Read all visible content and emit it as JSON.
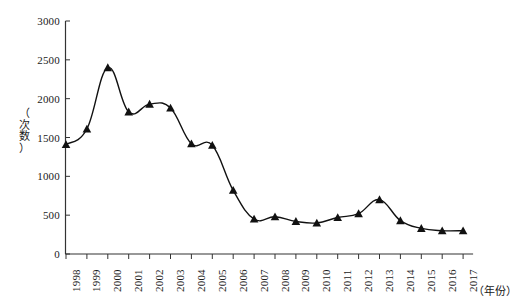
{
  "chart_data": {
    "type": "line",
    "title": "",
    "xlabel": "（年份）",
    "ylabel": "（次数）",
    "categories": [
      "1998",
      "1999",
      "2000",
      "2001",
      "2002",
      "2003",
      "2004",
      "2005",
      "2006",
      "2007",
      "2008",
      "2009",
      "2010",
      "2011",
      "2012",
      "2013",
      "2014",
      "2015",
      "2016",
      "2017"
    ],
    "values": [
      1410,
      1610,
      2400,
      1830,
      1930,
      1880,
      1420,
      1400,
      820,
      450,
      480,
      420,
      400,
      470,
      520,
      700,
      430,
      330,
      300,
      300
    ],
    "series": [
      {
        "name": "次数",
        "values": [
          1410,
          1610,
          2400,
          1830,
          1930,
          1880,
          1420,
          1400,
          820,
          450,
          480,
          420,
          400,
          470,
          520,
          700,
          430,
          330,
          300,
          300
        ]
      }
    ],
    "x_tick_labels": [
      "1998",
      "1999",
      "2000",
      "2001",
      "2002",
      "2003",
      "2004",
      "2005",
      "2006",
      "2007",
      "2008",
      "2009",
      "2010",
      "2011",
      "2012",
      "2013",
      "2014",
      "2015",
      "2016",
      "2017"
    ],
    "y_tick_labels": [
      "0",
      "500",
      "1000",
      "1500",
      "2000",
      "2500",
      "3000"
    ],
    "y_ticks": [
      0,
      500,
      1000,
      1500,
      2000,
      2500,
      3000
    ],
    "ylim": [
      0,
      3000
    ],
    "xlim_categories": 20,
    "grid": false,
    "legend": null,
    "legend_position": "none",
    "marker": "triangle",
    "marker_color": "#111111",
    "line_color": "#111111",
    "axis_color": "#333333",
    "background_color": "#ffffff"
  },
  "ylabel_chars": [
    "（",
    "次",
    "数",
    "）"
  ]
}
